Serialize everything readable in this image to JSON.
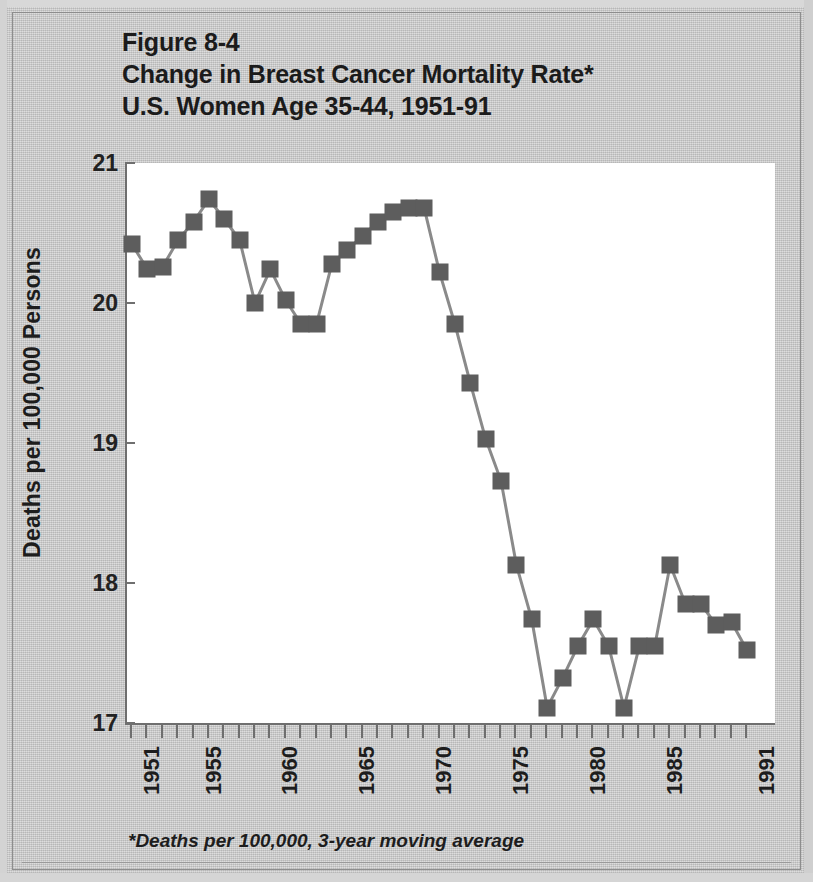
{
  "figure": {
    "label": "Figure 8-4",
    "title_line2": "Change in Breast Cancer Mortality Rate*",
    "title_line3": "U.S. Women Age 35-44, 1951-91",
    "footnote": "*Deaths per 100,000, 3-year moving average",
    "colors": {
      "background": "#c9c9c9",
      "plot_background": "#ffffff",
      "marker": "#5d5d5d",
      "line": "#8a8a8a",
      "axis": "#6f6f6f",
      "text": "#1d1d1d"
    }
  },
  "chart_data": {
    "type": "line",
    "title": "Change in Breast Cancer Mortality Rate* U.S. Women Age 35-44, 1951-91",
    "subtitle": "Figure 8-4",
    "xlabel": "",
    "ylabel": "Deaths per 100,000 Persons",
    "xlim": [
      1950.5,
      1991.5
    ],
    "ylim": [
      17,
      21
    ],
    "yticks": [
      17,
      18,
      19,
      20,
      21
    ],
    "ytick_labels": [
      "17",
      "18",
      "19",
      "20",
      "21"
    ],
    "xticks": [
      1951,
      1955,
      1960,
      1965,
      1970,
      1975,
      1980,
      1985,
      1991
    ],
    "xtick_labels": [
      "1951",
      "1955",
      "1960",
      "1965",
      "1970",
      "1975",
      "1980",
      "1985",
      "1991"
    ],
    "xtick_minor_every": 1,
    "grid": false,
    "legend": false,
    "markers": "square",
    "annotation": "*Deaths per 100,000, 3-year moving average",
    "x": [
      1951,
      1952,
      1953,
      1954,
      1955,
      1956,
      1957,
      1958,
      1959,
      1960,
      1961,
      1962,
      1963,
      1964,
      1965,
      1966,
      1967,
      1968,
      1969,
      1970,
      1971,
      1972,
      1973,
      1974,
      1975,
      1976,
      1977,
      1978,
      1979,
      1980,
      1981,
      1982,
      1983,
      1984,
      1985,
      1986,
      1987,
      1988,
      1989,
      1990,
      1991
    ],
    "values": [
      20.42,
      20.24,
      20.26,
      20.45,
      20.58,
      20.74,
      20.6,
      20.45,
      20.0,
      20.24,
      20.02,
      19.85,
      19.85,
      20.28,
      20.38,
      20.48,
      20.58,
      20.65,
      20.68,
      20.68,
      20.22,
      19.85,
      19.43,
      19.03,
      18.73,
      18.13,
      17.74,
      17.11,
      17.32,
      17.55,
      17.74,
      17.55,
      17.11,
      17.55,
      17.55,
      18.13,
      17.85,
      17.85,
      17.7,
      17.72,
      17.52
    ],
    "series": [
      {
        "name": "Breast cancer mortality rate, U.S. women age 35-44 (3-year moving average)",
        "values": [
          20.42,
          20.24,
          20.26,
          20.45,
          20.58,
          20.74,
          20.6,
          20.45,
          20.0,
          20.24,
          20.02,
          19.85,
          19.85,
          20.28,
          20.38,
          20.48,
          20.58,
          20.65,
          20.68,
          20.68,
          20.22,
          19.85,
          19.43,
          19.03,
          18.73,
          18.13,
          17.74,
          17.11,
          17.32,
          17.55,
          17.74,
          17.55,
          17.11,
          17.55,
          17.55,
          18.13,
          17.85,
          17.85,
          17.7,
          17.72,
          17.52
        ]
      }
    ]
  }
}
